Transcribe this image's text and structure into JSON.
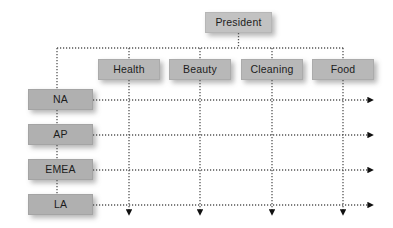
{
  "diagram": {
    "type": "matrix-organization-chart",
    "title_node": {
      "label": "President"
    },
    "product_divisions": [
      {
        "label": "Health",
        "x": 129
      },
      {
        "label": "Beauty",
        "x": 200
      },
      {
        "label": "Cleaning",
        "x": 272
      },
      {
        "label": "Food",
        "x": 343
      }
    ],
    "regions": [
      {
        "label": "NA",
        "y": 100
      },
      {
        "label": "AP",
        "y": 135
      },
      {
        "label": "EMEA",
        "y": 170
      },
      {
        "label": "LA",
        "y": 205
      }
    ],
    "colors": {
      "box_fill": "#b3b3b3",
      "box_text": "#1c1c1c",
      "line": "#555555",
      "arrow": "#111111",
      "background": "#ffffff"
    },
    "connector_style": "dotted",
    "arrow_directions": {
      "rows": "right",
      "columns": "down"
    }
  }
}
